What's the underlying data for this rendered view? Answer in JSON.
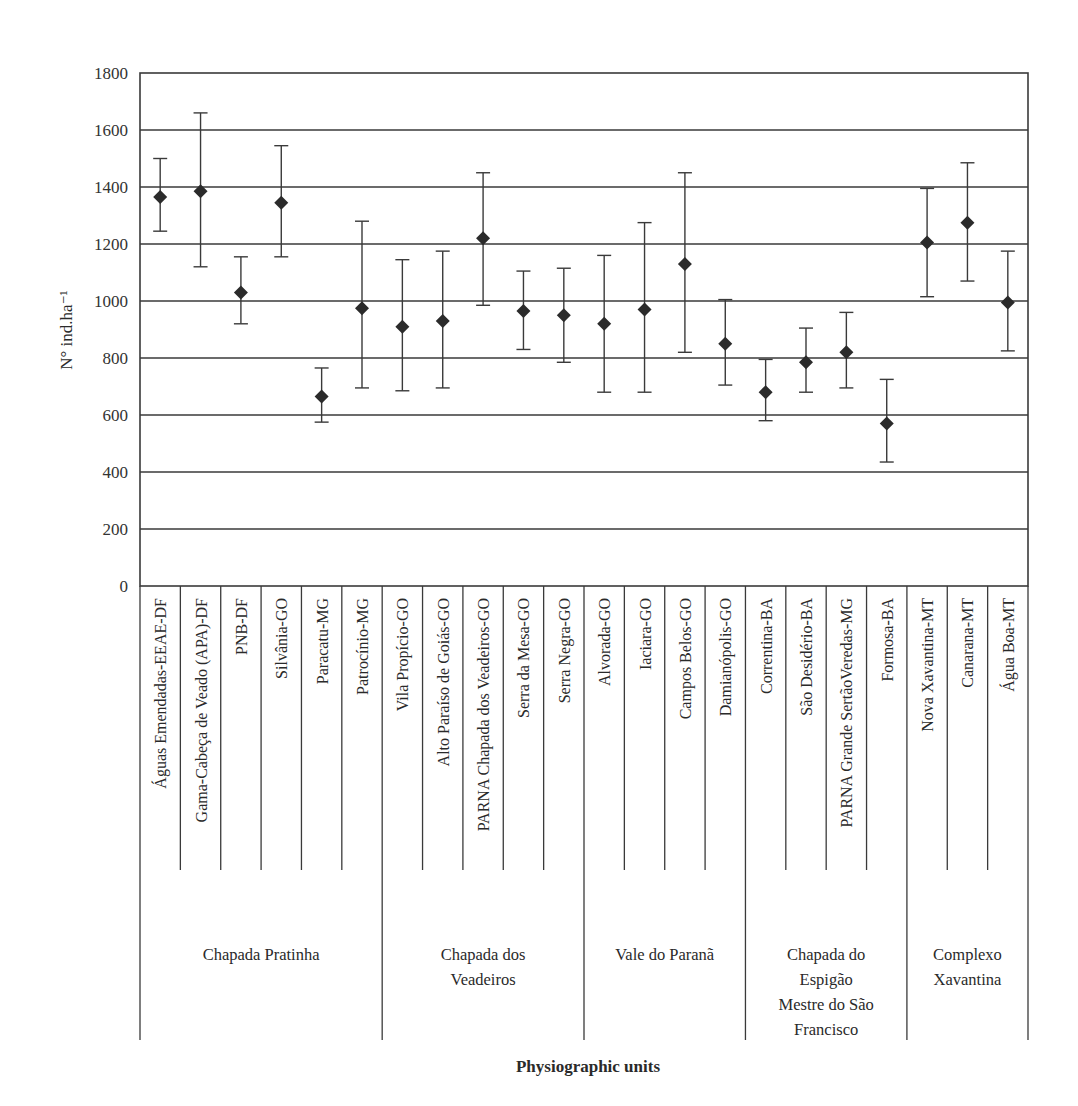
{
  "chart_data": {
    "type": "scatter",
    "subtype": "point-with-error-bars",
    "title": "",
    "xlabel": "Physiographic units",
    "ylabel": "N° ind.ha⁻¹",
    "ylim": [
      0,
      1800
    ],
    "yticks": [
      0,
      200,
      400,
      600,
      800,
      1000,
      1200,
      1400,
      1600,
      1800
    ],
    "grid": "horizontal",
    "legend": null,
    "marker": "diamond",
    "categories": [
      "Águas Emendadas-EEAE-DF",
      "Gama-Cabeça de Veado (APA)-DF",
      "PNB-DF",
      "Silvânia-GO",
      "Paracatu-MG",
      "Patrocínio-MG",
      "Vila Propício-GO",
      "Alto Paraíso de Goiás-GO",
      "PARNA Chapada dos Veadeiros-GO",
      "Serra da Mesa-GO",
      "Serra Negra-GO",
      "Alvorada-GO",
      "Iaciara-GO",
      "Campos Belos-GO",
      "Damianópolis-GO",
      "Correntina-BA",
      "São Desidério-BA",
      "PARNA Grande SertãoVeredas-MG",
      "Formosa-BA",
      "Nova Xavantina-MT",
      "Canarana-MT",
      "Água Boa-MT"
    ],
    "values": [
      1365,
      1385,
      1030,
      1345,
      665,
      975,
      910,
      930,
      1220,
      965,
      950,
      920,
      970,
      1130,
      850,
      680,
      785,
      820,
      570,
      1205,
      1275,
      995
    ],
    "upper": [
      1500,
      1660,
      1155,
      1545,
      765,
      1280,
      1145,
      1175,
      1450,
      1105,
      1115,
      1160,
      1275,
      1450,
      1005,
      795,
      905,
      960,
      725,
      1395,
      1485,
      1175
    ],
    "lower": [
      1245,
      1120,
      920,
      1155,
      575,
      695,
      685,
      695,
      985,
      830,
      785,
      680,
      680,
      820,
      705,
      580,
      680,
      695,
      435,
      1015,
      1070,
      825
    ],
    "groups": [
      {
        "label": [
          "Chapada Pratinha"
        ],
        "start": 0,
        "end": 5
      },
      {
        "label": [
          "Chapada dos",
          "Veadeiros"
        ],
        "start": 6,
        "end": 10
      },
      {
        "label": [
          "Vale do Paranã"
        ],
        "start": 11,
        "end": 14
      },
      {
        "label": [
          "Chapada do",
          "Espigão",
          "Mestre do São",
          "Francisco"
        ],
        "start": 15,
        "end": 18
      },
      {
        "label": [
          "Complexo",
          "Xavantina"
        ],
        "start": 19,
        "end": 21
      }
    ]
  },
  "colors": {
    "line": "#3a3a3a",
    "marker": "#2b2b2b",
    "text": "#2a2a2a",
    "background": "#ffffff"
  }
}
